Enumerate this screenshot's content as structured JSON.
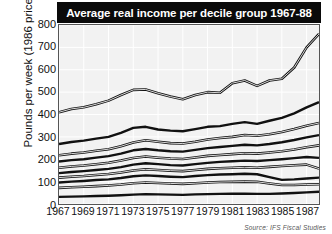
{
  "chart_data": {
    "type": "line",
    "title": "Average real income per decile group 1967-88",
    "xlabel": "",
    "ylabel": "Pounds per week (1986 prices)",
    "xlim": [
      1967,
      1988
    ],
    "ylim": [
      0,
      800
    ],
    "ytick_labels": [
      "0",
      "100",
      "200",
      "300",
      "400",
      "500",
      "600",
      "700",
      "800"
    ],
    "ytick_values": [
      0,
      100,
      200,
      300,
      400,
      500,
      600,
      700,
      800
    ],
    "xtick_labels": [
      "1967",
      "1969",
      "1971",
      "1973",
      "1975",
      "1977",
      "1979",
      "1981",
      "1983",
      "1985",
      "1987"
    ],
    "xtick_values": [
      1967,
      1969,
      1971,
      1973,
      1975,
      1977,
      1979,
      1981,
      1983,
      1985,
      1987
    ],
    "grid": true,
    "legend": "none",
    "source_note": "Source: IFS Fiscal Studies",
    "x": [
      1967,
      1968,
      1969,
      1970,
      1971,
      1972,
      1973,
      1974,
      1975,
      1976,
      1977,
      1978,
      1979,
      1980,
      1981,
      1982,
      1983,
      1984,
      1985,
      1986,
      1987,
      1988
    ],
    "series": [
      {
        "name": "Decile 10 (top)",
        "style": "double",
        "values": [
          410,
          425,
          432,
          446,
          462,
          487,
          510,
          512,
          495,
          480,
          468,
          487,
          500,
          497,
          540,
          552,
          528,
          552,
          560,
          610,
          700,
          760
        ]
      },
      {
        "name": "Decile 9",
        "style": "thick",
        "values": [
          268,
          277,
          283,
          292,
          300,
          318,
          340,
          345,
          333,
          328,
          325,
          335,
          345,
          348,
          358,
          366,
          358,
          372,
          385,
          405,
          432,
          455
        ]
      },
      {
        "name": "Decile 8",
        "style": "double",
        "values": [
          218,
          225,
          230,
          238,
          245,
          258,
          275,
          285,
          278,
          272,
          270,
          278,
          288,
          295,
          300,
          308,
          305,
          312,
          322,
          335,
          350,
          362
        ]
      },
      {
        "name": "Decile 7",
        "style": "thick",
        "values": [
          190,
          196,
          200,
          207,
          214,
          225,
          240,
          246,
          240,
          236,
          234,
          242,
          250,
          255,
          260,
          265,
          262,
          268,
          276,
          286,
          298,
          308
        ]
      },
      {
        "name": "Decile 6",
        "style": "double",
        "values": [
          162,
          168,
          172,
          178,
          184,
          194,
          206,
          212,
          207,
          203,
          201,
          208,
          215,
          219,
          223,
          227,
          225,
          230,
          236,
          244,
          254,
          262
        ]
      },
      {
        "name": "Decile 5",
        "style": "thick",
        "values": [
          138,
          143,
          147,
          152,
          157,
          165,
          176,
          182,
          178,
          174,
          172,
          178,
          184,
          188,
          191,
          194,
          192,
          196,
          200,
          205,
          210,
          206
        ]
      },
      {
        "name": "Decile 4",
        "style": "double",
        "values": [
          118,
          122,
          125,
          130,
          134,
          141,
          150,
          155,
          152,
          149,
          147,
          152,
          157,
          160,
          162,
          164,
          162,
          166,
          170,
          173,
          176,
          158
        ]
      },
      {
        "name": "Decile 3",
        "style": "thick",
        "values": [
          96,
          100,
          103,
          107,
          110,
          116,
          124,
          128,
          125,
          122,
          120,
          125,
          129,
          132,
          133,
          135,
          133,
          120,
          108,
          110,
          114,
          118
        ]
      },
      {
        "name": "Decile 2",
        "style": "double",
        "values": [
          72,
          75,
          77,
          80,
          83,
          87,
          93,
          96,
          94,
          92,
          90,
          93,
          96,
          98,
          99,
          100,
          99,
          92,
          85,
          85,
          87,
          88
        ]
      },
      {
        "name": "Decile 1 (bottom)",
        "style": "thick",
        "values": [
          32,
          33,
          34,
          36,
          37,
          39,
          42,
          44,
          43,
          42,
          41,
          43,
          44,
          45,
          46,
          46,
          45,
          45,
          47,
          49,
          52,
          55
        ]
      }
    ]
  },
  "figure": {
    "title": "Average real income per decile group 1967-88",
    "ylabel": "Pounds per week (1986 prices)",
    "source": "Source: IFS Fiscal Studies"
  },
  "colors": {
    "title_bar_bg": "#0a0a0a",
    "title_text": "#ffffff",
    "plot_bg": "#f2f2f2",
    "line": "#111111",
    "axis": "#555555",
    "page_bg": "#ffffff"
  }
}
